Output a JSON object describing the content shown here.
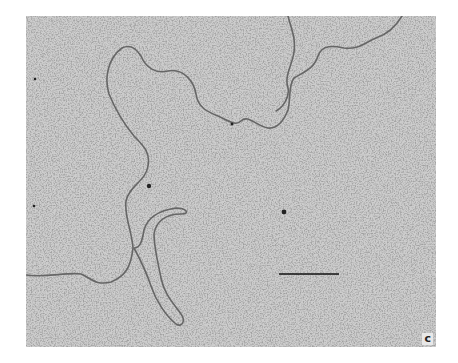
{
  "figure": {
    "type": "electron micrograph",
    "panel_label": "c",
    "scale_bar": {
      "x1": 253,
      "x2": 313,
      "y": 258
    },
    "colors": {
      "background": "#c9c9c9",
      "strand": "#6a6a6a",
      "speckle": "#5a5a5a"
    }
  }
}
